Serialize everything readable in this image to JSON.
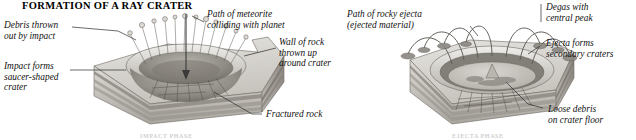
{
  "figure": {
    "title": "FORMATION OF A RAY CRATER",
    "panels": [
      {
        "name": "impact-panel",
        "caption": "IMPACT PHASE",
        "labels": [
          {
            "key": "debris-thrown-out",
            "text": "Debris thrown\nout by impact"
          },
          {
            "key": "path-of-meteorite",
            "text": "Path of meteorite\ncolliding with planet"
          },
          {
            "key": "wall-of-rock",
            "text": "Wall of rock\nthrown up\naround crater"
          },
          {
            "key": "impact-forms-crater",
            "text": "Impact forms\nsaucer-shaped\ncrater"
          },
          {
            "key": "fractured-rock",
            "text": "Fractured rock"
          }
        ]
      },
      {
        "name": "ejecta-panel",
        "caption": "EJECTA PHASE",
        "labels": [
          {
            "key": "path-of-rocky-ejecta",
            "text": "Path of rocky ejecta\n(ejected material)"
          },
          {
            "key": "degas-central-peak",
            "text": "Degas with\ncentral peak"
          },
          {
            "key": "ejecta-secondary-craters",
            "text": "Ejecta forms\nsecondary craters"
          },
          {
            "key": "loose-debris",
            "text": "Loose debris\non crater floor"
          }
        ]
      }
    ]
  },
  "colors": {
    "ink": "#1a1a1a",
    "leader_line": "#2b2b2b",
    "rock_light": "#e3e1dd",
    "rock_mid": "#c9c6c0",
    "rock_dark": "#9c9892",
    "rock_darkest": "#726e68",
    "strata_band": "#8e8a84",
    "crater_shadow": "#8a8680",
    "surface_top": "#d8d5d0"
  }
}
